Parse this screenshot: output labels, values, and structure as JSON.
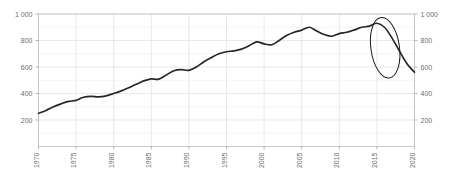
{
  "chart_data": {
    "type": "line",
    "title": "",
    "subtitle": "",
    "xlabel": "",
    "ylabel": "",
    "xlim": [
      1970,
      2020
    ],
    "ylim": [
      0,
      1000
    ],
    "grid": true,
    "legend": null,
    "y_ticks": [
      200,
      400,
      600,
      800,
      1000
    ],
    "y_tick_labels": [
      "200",
      "400",
      "600",
      "800",
      "1 000"
    ],
    "y_tick_labels_right": [
      "200",
      "400",
      "600",
      "800",
      "1 000"
    ],
    "y_minor_step": 100,
    "x_ticks": [
      1970,
      1975,
      1980,
      1985,
      1990,
      1995,
      2000,
      2005,
      2010,
      2015,
      2020
    ],
    "x_tick_labels": [
      "1970",
      "1975",
      "1980",
      "1985",
      "1990",
      "1995",
      "2000",
      "2005",
      "2010",
      "2015",
      "2020"
    ],
    "x_tick_rotation": -90,
    "series": [
      {
        "name": "series-1",
        "color": "#262626",
        "x": [
          1970,
          1971,
          1972,
          1973,
          1974,
          1975,
          1976,
          1977,
          1978,
          1979,
          1980,
          1981,
          1982,
          1983,
          1984,
          1985,
          1986,
          1987,
          1988,
          1989,
          1990,
          1991,
          1992,
          1993,
          1994,
          1995,
          1996,
          1997,
          1998,
          1999,
          2000,
          2001,
          2002,
          2003,
          2004,
          2005,
          2006,
          2007,
          2008,
          2009,
          2010,
          2011,
          2012,
          2013,
          2014,
          2015,
          2016,
          2017,
          2018,
          2019,
          2020
        ],
        "values": [
          250,
          272,
          300,
          322,
          340,
          348,
          372,
          378,
          374,
          382,
          400,
          420,
          444,
          470,
          495,
          510,
          508,
          540,
          572,
          580,
          575,
          600,
          640,
          672,
          700,
          715,
          722,
          735,
          760,
          790,
          775,
          768,
          800,
          838,
          862,
          878,
          900,
          872,
          845,
          832,
          852,
          862,
          880,
          900,
          908,
          930,
          900,
          820,
          720,
          625,
          560
        ]
      }
    ],
    "annotations": [
      {
        "type": "ellipse",
        "name": "highlight-ellipse",
        "center_x": 2016.1,
        "center_y": 745,
        "radius_x": 1.9,
        "radius_y": 230,
        "rotation_deg": -8,
        "color": "#1a1a1a"
      }
    ]
  }
}
